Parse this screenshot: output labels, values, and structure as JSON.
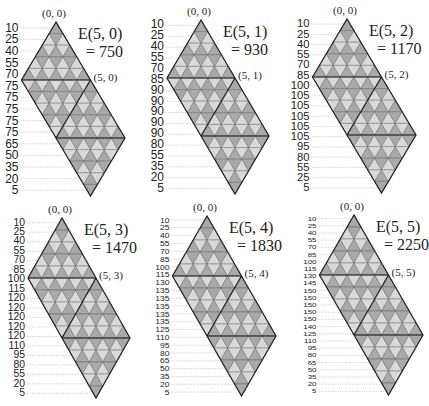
{
  "colors": {
    "dark_fill": "#a9a9a9",
    "light_fill": "#d9d9d9",
    "outline": "#222222",
    "grid": "#555555",
    "guide": "#bdbdbd",
    "text": "#222222"
  },
  "panels": [
    {
      "id": "E50",
      "title": "E(5, 0)",
      "value": "= 750",
      "apex_label": "(0, 0)",
      "corner_label": "(5, 0)",
      "rows_labels": [
        "10",
        "25",
        "40",
        "55",
        "70",
        "75",
        "75",
        "75",
        "75",
        "75",
        "65",
        "50",
        "35",
        "20",
        "5"
      ],
      "origin": [
        0,
        0
      ],
      "geom": {
        "ax": 56,
        "ay": 22,
        "w": 69,
        "h": 58
      }
    },
    {
      "id": "E51",
      "title": "E(5, 1)",
      "value": "= 930",
      "apex_label": "(0, 0)",
      "corner_label": "(5, 1)",
      "rows_labels": [
        "10",
        "25",
        "40",
        "55",
        "70",
        "85",
        "90",
        "90",
        "90",
        "90",
        "90",
        "80",
        "55",
        "35",
        "20",
        "5"
      ],
      "origin": [
        0,
        0
      ],
      "geom": {
        "ax": 201,
        "ay": 20,
        "w": 68,
        "h": 58
      }
    },
    {
      "id": "E52",
      "title": "E(5, 2)",
      "value": "= 1170",
      "apex_label": "(0, 0)",
      "corner_label": "(5, 2)",
      "rows_labels": [
        "10",
        "25",
        "40",
        "55",
        "70",
        "85",
        "100",
        "105",
        "105",
        "105",
        "105",
        "105",
        "95",
        "80",
        "55",
        "25",
        "5"
      ],
      "origin": [
        0,
        0
      ],
      "geom": {
        "ax": 347,
        "ay": 19,
        "w": 69,
        "h": 58
      }
    },
    {
      "id": "E53",
      "title": "E(5, 3)",
      "value": "= 1470",
      "apex_label": "(0, 0)",
      "corner_label": "(5, 3)",
      "rows_labels": [
        "10",
        "25",
        "40",
        "55",
        "70",
        "85",
        "100",
        "115",
        "120",
        "120",
        "120",
        "120",
        "120",
        "110",
        "95",
        "80",
        "55",
        "20",
        "5"
      ],
      "origin": [
        0,
        0
      ],
      "geom": {
        "ax": 62,
        "ay": 218,
        "w": 68,
        "h": 60
      }
    },
    {
      "id": "E54",
      "title": "E(5, 4)",
      "value": "= 1830",
      "apex_label": "(0, 0)",
      "corner_label": "(5, 4)",
      "rows_labels": [
        "10",
        "25",
        "40",
        "55",
        "70",
        "85",
        "100",
        "115",
        "130",
        "135",
        "135",
        "135",
        "135",
        "135",
        "125",
        "110",
        "95",
        "80",
        "65",
        "50",
        "35",
        "20",
        "5"
      ],
      "origin": [
        0,
        0
      ],
      "geom": {
        "ax": 207,
        "ay": 216,
        "w": 69,
        "h": 60
      }
    },
    {
      "id": "E55",
      "title": "E(5, 5)",
      "value": "= 2250",
      "apex_label": "(0, 0)",
      "corner_label": "(5, 5)",
      "rows_labels": [
        "10",
        "25",
        "40",
        "55",
        "70",
        "85",
        "100",
        "115",
        "130",
        "145",
        "150",
        "150",
        "150",
        "150",
        "150",
        "140",
        "125",
        "110",
        "95",
        "80",
        "65",
        "50",
        "35",
        "20",
        "5"
      ],
      "origin": [
        0,
        0
      ],
      "geom": {
        "ax": 354,
        "ay": 215,
        "w": 69,
        "h": 60
      }
    }
  ]
}
